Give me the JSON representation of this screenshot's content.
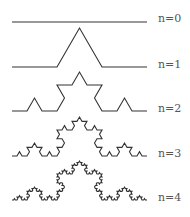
{
  "stroke_color": "#333333",
  "x_start": 12,
  "x_end": 147,
  "curves": [
    {
      "label": "n=0",
      "order": 0,
      "baseline_y": 22
    },
    {
      "label": "n=1",
      "order": 1,
      "baseline_y": 67
    },
    {
      "label": "n=2",
      "order": 2,
      "baseline_y": 111
    },
    {
      "label": "n=3",
      "order": 3,
      "baseline_y": 156
    },
    {
      "label": "n=4",
      "order": 4,
      "baseline_y": 200
    }
  ]
}
